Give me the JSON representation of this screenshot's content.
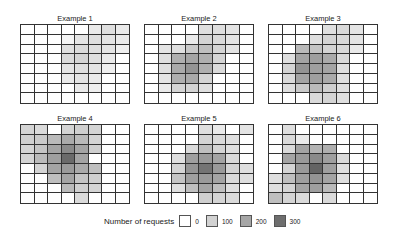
{
  "chart_data": {
    "type": "heatmap",
    "title": "",
    "legend": {
      "title": "Number of requests",
      "position": "bottom",
      "entries": [
        {
          "label": "0",
          "value": 0,
          "color": "#ffffff"
        },
        {
          "label": "100",
          "value": 100,
          "color": "#d2d2d2"
        },
        {
          "label": "200",
          "value": 200,
          "color": "#a6a6a6"
        },
        {
          "label": "300",
          "value": 300,
          "color": "#6e6e6e"
        }
      ]
    },
    "grid": {
      "rows": 8,
      "cols": 8
    },
    "panels": [
      {
        "title": "Example 1",
        "values": [
          [
            0,
            0,
            0,
            0,
            0,
            40,
            60,
            40
          ],
          [
            0,
            0,
            0,
            20,
            50,
            60,
            50,
            40
          ],
          [
            0,
            0,
            0,
            60,
            70,
            60,
            50,
            30
          ],
          [
            0,
            0,
            0,
            70,
            80,
            60,
            40,
            0
          ],
          [
            0,
            0,
            0,
            50,
            60,
            50,
            30,
            0
          ],
          [
            0,
            0,
            0,
            40,
            50,
            40,
            0,
            0
          ],
          [
            0,
            0,
            0,
            0,
            40,
            30,
            0,
            0
          ],
          [
            0,
            0,
            0,
            0,
            0,
            0,
            0,
            0
          ]
        ]
      },
      {
        "title": "Example 2",
        "values": [
          [
            0,
            0,
            0,
            0,
            60,
            60,
            50,
            0
          ],
          [
            0,
            0,
            0,
            40,
            80,
            70,
            50,
            0
          ],
          [
            0,
            50,
            60,
            100,
            120,
            80,
            50,
            0
          ],
          [
            0,
            60,
            150,
            170,
            150,
            80,
            0,
            0
          ],
          [
            0,
            60,
            160,
            200,
            150,
            70,
            0,
            0
          ],
          [
            0,
            50,
            150,
            160,
            80,
            0,
            0,
            0
          ],
          [
            0,
            40,
            80,
            80,
            60,
            0,
            0,
            0
          ],
          [
            0,
            0,
            0,
            0,
            0,
            0,
            0,
            0
          ]
        ]
      },
      {
        "title": "Example 3",
        "values": [
          [
            0,
            0,
            0,
            0,
            60,
            70,
            50,
            0
          ],
          [
            0,
            0,
            0,
            60,
            80,
            70,
            50,
            0
          ],
          [
            0,
            0,
            130,
            110,
            80,
            70,
            40,
            0
          ],
          [
            0,
            60,
            170,
            180,
            160,
            70,
            0,
            0
          ],
          [
            0,
            80,
            200,
            180,
            170,
            60,
            0,
            0
          ],
          [
            0,
            70,
            170,
            180,
            160,
            60,
            0,
            0
          ],
          [
            0,
            60,
            100,
            130,
            90,
            60,
            0,
            0
          ],
          [
            0,
            0,
            0,
            70,
            80,
            60,
            0,
            0
          ]
        ]
      },
      {
        "title": "Example 4",
        "values": [
          [
            80,
            70,
            0,
            80,
            90,
            80,
            0,
            0
          ],
          [
            90,
            100,
            130,
            160,
            130,
            80,
            0,
            0
          ],
          [
            80,
            110,
            170,
            220,
            170,
            90,
            0,
            0
          ],
          [
            80,
            130,
            180,
            280,
            170,
            0,
            0,
            0
          ],
          [
            0,
            80,
            170,
            190,
            160,
            120,
            0,
            0
          ],
          [
            0,
            0,
            120,
            170,
            110,
            90,
            0,
            0
          ],
          [
            0,
            0,
            0,
            130,
            90,
            80,
            0,
            0
          ],
          [
            0,
            0,
            0,
            0,
            70,
            0,
            0,
            0
          ]
        ]
      },
      {
        "title": "Example 5",
        "values": [
          [
            0,
            0,
            0,
            0,
            60,
            40,
            0,
            50
          ],
          [
            0,
            0,
            0,
            0,
            80,
            70,
            60,
            0
          ],
          [
            0,
            0,
            0,
            70,
            120,
            80,
            60,
            0
          ],
          [
            0,
            0,
            60,
            180,
            190,
            170,
            70,
            0
          ],
          [
            0,
            0,
            80,
            200,
            260,
            190,
            80,
            60
          ],
          [
            0,
            0,
            110,
            180,
            190,
            170,
            70,
            60
          ],
          [
            0,
            0,
            60,
            120,
            170,
            120,
            60,
            0
          ],
          [
            0,
            0,
            0,
            0,
            90,
            80,
            70,
            0
          ]
        ]
      },
      {
        "title": "Example 6",
        "values": [
          [
            0,
            60,
            0,
            0,
            0,
            0,
            0,
            0
          ],
          [
            0,
            70,
            40,
            0,
            0,
            0,
            0,
            0
          ],
          [
            0,
            70,
            170,
            140,
            150,
            0,
            0,
            0
          ],
          [
            0,
            170,
            190,
            220,
            180,
            70,
            0,
            0
          ],
          [
            0,
            80,
            190,
            290,
            180,
            60,
            0,
            0
          ],
          [
            60,
            120,
            180,
            200,
            170,
            60,
            0,
            0
          ],
          [
            60,
            80,
            170,
            180,
            130,
            0,
            0,
            0
          ],
          [
            120,
            80,
            70,
            0,
            70,
            0,
            0,
            0
          ]
        ]
      }
    ]
  }
}
